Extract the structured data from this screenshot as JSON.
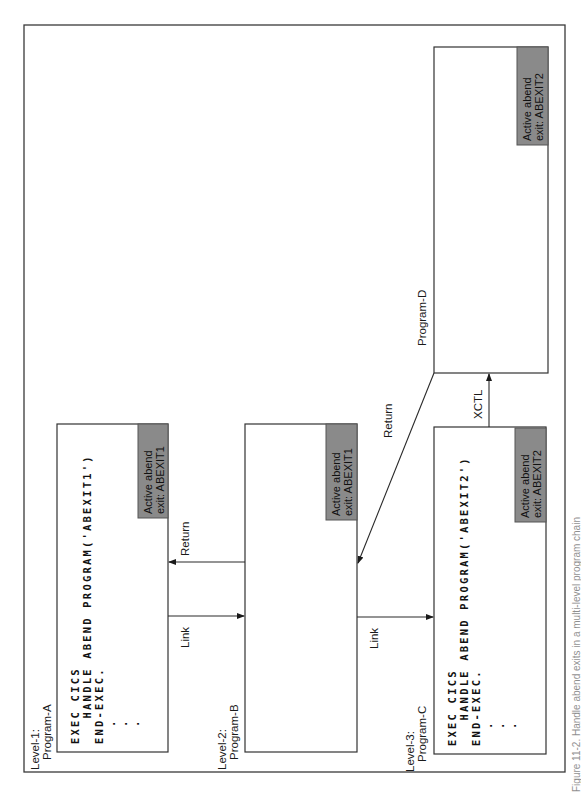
{
  "figure": {
    "caption": "Figure 11-2. Handle abend exits in a multi-level program chain"
  },
  "programs": [
    {
      "id": "A",
      "level_label": "Level-1:",
      "name": "Program-A",
      "code": [
        "EXEC CICS",
        "   HANDLE ABEND PROGRAM('ABEXIT1')",
        "END-EXEC.",
        "  .",
        "  .",
        "  ."
      ],
      "abend_line1": "Active abend",
      "abend_line2": "exit: ABEXIT1"
    },
    {
      "id": "B",
      "level_label": "Level-2:",
      "name": "Program-B",
      "code": [],
      "abend_line1": "Active abend",
      "abend_line2": "exit: ABEXIT1"
    },
    {
      "id": "C",
      "level_label": "Level-3:",
      "name": "Program-C",
      "code": [
        "EXEC CICS",
        "   HANDLE ABEND PROGRAM('ABEXIT2')",
        "END-EXEC.",
        "  .",
        "  .",
        "  ."
      ],
      "abend_line1": "Active abend",
      "abend_line2": "exit: ABEXIT2"
    },
    {
      "id": "D",
      "level_label": "",
      "name": "Program-D",
      "code": [],
      "abend_line1": "Active abend",
      "abend_line2": "exit: ABEXIT2"
    }
  ],
  "arrows": [
    {
      "from": "B",
      "to": "A",
      "label": "Return"
    },
    {
      "from": "A",
      "to": "B",
      "label": "Link"
    },
    {
      "from": "B",
      "to": "C",
      "label": "Link"
    },
    {
      "from": "D",
      "to": "B",
      "label": "Return"
    },
    {
      "from": "C",
      "to": "D",
      "label": "XCTL"
    }
  ],
  "colors": {
    "abend_fill": "#8a8a8a",
    "line": "#2a2a2a"
  }
}
